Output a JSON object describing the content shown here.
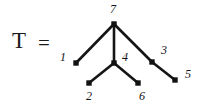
{
  "figure": {
    "name": "tree-diagram",
    "equation_left": "T",
    "equation_operator": "=",
    "background_color": "#ffffff",
    "ink_color": "#151515",
    "node_color": "#111111",
    "edge_color": "#151515"
  },
  "chart_data": {
    "type": "diagram",
    "title": "T",
    "subtype": "rooted-tree",
    "node_count": 7,
    "edge_count": 6,
    "nodes": [
      {
        "id": "7",
        "label": "7",
        "x": 114,
        "y": 24,
        "label_x": 110,
        "label_y": 3,
        "role": "root"
      },
      {
        "id": "1",
        "label": "1",
        "x": 76,
        "y": 63,
        "label_x": 60,
        "label_y": 51,
        "role": "leaf"
      },
      {
        "id": "4",
        "label": "4",
        "x": 114,
        "y": 63,
        "label_x": 122,
        "label_y": 51,
        "role": "internal"
      },
      {
        "id": "3",
        "label": "3",
        "x": 152,
        "y": 62,
        "label_x": 161,
        "label_y": 44,
        "role": "internal"
      },
      {
        "id": "2",
        "label": "2",
        "x": 89,
        "y": 83,
        "label_x": 86,
        "label_y": 90,
        "role": "leaf"
      },
      {
        "id": "6",
        "label": "6",
        "x": 138,
        "y": 83,
        "label_x": 139,
        "label_y": 90,
        "role": "leaf"
      },
      {
        "id": "5",
        "label": "5",
        "x": 175,
        "y": 80,
        "label_x": 185,
        "label_y": 68,
        "role": "leaf"
      }
    ],
    "edges": [
      {
        "from": "7",
        "to": "1"
      },
      {
        "from": "7",
        "to": "4"
      },
      {
        "from": "7",
        "to": "3"
      },
      {
        "from": "4",
        "to": "2"
      },
      {
        "from": "4",
        "to": "6"
      },
      {
        "from": "3",
        "to": "5"
      }
    ]
  }
}
